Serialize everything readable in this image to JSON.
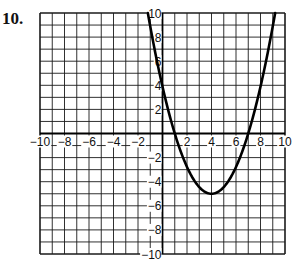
{
  "problem": {
    "number": "10."
  },
  "chart_data": {
    "type": "line",
    "title": "",
    "xlabel": "",
    "ylabel": "",
    "xlim": [
      -10,
      10
    ],
    "ylim": [
      -10,
      10
    ],
    "grid": true,
    "grid_step": 1,
    "x_ticks": [
      -10,
      -8,
      -6,
      -4,
      -2,
      2,
      4,
      6,
      8,
      10
    ],
    "y_ticks": [
      -10,
      -8,
      -6,
      -4,
      -2,
      2,
      4,
      6,
      8,
      10
    ],
    "x_tick_labels": [
      "−10",
      "−8",
      "−6",
      "−4",
      "−2",
      "2",
      "4",
      "6",
      "8",
      "10"
    ],
    "y_tick_labels": [
      "−10",
      "−8",
      "−6",
      "−4",
      "−2",
      "2",
      "4",
      "6",
      "8",
      "10"
    ],
    "series": [
      {
        "name": "parabola",
        "description": "Upward-opening parabola, vertex (4, -5), x-intercepts ~1 and ~7, y-intercept ~4",
        "vertex": [
          4,
          -5
        ],
        "x_intercepts": [
          1,
          7
        ],
        "y_intercept": 3.9,
        "points": [
          [
            -1.2,
            10
          ],
          [
            -0.5,
            6.25
          ],
          [
            0,
            3.89
          ],
          [
            0.5,
            1.81
          ],
          [
            1,
            0
          ],
          [
            1.5,
            -1.53
          ],
          [
            2,
            -2.78
          ],
          [
            2.5,
            -3.75
          ],
          [
            3,
            -4.44
          ],
          [
            3.5,
            -4.86
          ],
          [
            4,
            -5
          ],
          [
            4.5,
            -4.86
          ],
          [
            5,
            -4.44
          ],
          [
            5.5,
            -3.75
          ],
          [
            6,
            -2.78
          ],
          [
            6.5,
            -1.53
          ],
          [
            7,
            0
          ],
          [
            7.5,
            1.81
          ],
          [
            8,
            3.89
          ],
          [
            8.5,
            6.25
          ],
          [
            9,
            8.89
          ],
          [
            9.2,
            10
          ]
        ]
      }
    ],
    "colors": {
      "grid": "#1a1a1a",
      "curve": "#000000",
      "background": "#ffffff"
    }
  }
}
